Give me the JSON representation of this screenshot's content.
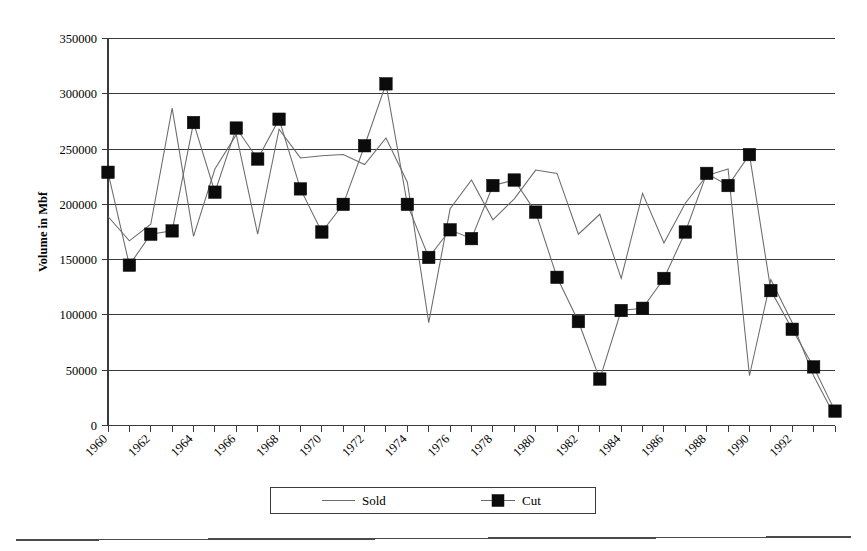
{
  "chart_data": {
    "type": "line",
    "title": "",
    "xlabel": "",
    "ylabel": "Volume in Mbf",
    "ylim": [
      0,
      350000
    ],
    "ytick_step": 50000,
    "yticks": [
      "0",
      "50000",
      "100000",
      "150000",
      "200000",
      "250000",
      "300000",
      "350000"
    ],
    "ytick_values": [
      0,
      50000,
      100000,
      150000,
      200000,
      250000,
      300000,
      350000
    ],
    "grid": true,
    "grid_axis": "y",
    "legend_position": "bottom-center",
    "x": [
      1960,
      1961,
      1962,
      1963,
      1964,
      1965,
      1966,
      1967,
      1968,
      1969,
      1970,
      1971,
      1972,
      1973,
      1974,
      1975,
      1976,
      1977,
      1978,
      1979,
      1980,
      1981,
      1982,
      1983,
      1984,
      1985,
      1986,
      1987,
      1988,
      1989,
      1990,
      1991,
      1992,
      1993,
      1994
    ],
    "xticks_labeled": [
      "1960",
      "1962",
      "1964",
      "1966",
      "1968",
      "1970",
      "1972",
      "1974",
      "1976",
      "1978",
      "1980",
      "1982",
      "1984",
      "1986",
      "1988",
      "1990",
      "1992"
    ],
    "xlim": [
      1960,
      1994
    ],
    "series": [
      {
        "name": "Sold",
        "marker": "none",
        "color": "#6b6b6b",
        "values": [
          189000,
          167000,
          182000,
          287000,
          171000,
          232000,
          263000,
          173000,
          268000,
          242000,
          244000,
          245000,
          236000,
          260000,
          220000,
          93000,
          196000,
          222000,
          186000,
          205000,
          231000,
          228000,
          173000,
          191000,
          133000,
          210000,
          165000,
          201000,
          226000,
          232000,
          45000,
          132000,
          93000,
          45000,
          8000
        ]
      },
      {
        "name": "Cut",
        "marker": "square",
        "color": "#0b0b0b",
        "values": [
          229000,
          145000,
          173000,
          176000,
          274000,
          211000,
          269000,
          241000,
          277000,
          214000,
          175000,
          200000,
          253000,
          309000,
          200000,
          152000,
          177000,
          169000,
          217000,
          222000,
          193000,
          134000,
          94000,
          42000,
          104000,
          106000,
          133000,
          175000,
          228000,
          217000,
          245000,
          122000,
          87000,
          53000,
          13000
        ]
      }
    ]
  },
  "legend": {
    "items": [
      {
        "label": "Sold",
        "marker": "line"
      },
      {
        "label": "Cut",
        "marker": "line-square"
      }
    ]
  },
  "axis": {
    "y_title": "Volume in Mbf"
  }
}
